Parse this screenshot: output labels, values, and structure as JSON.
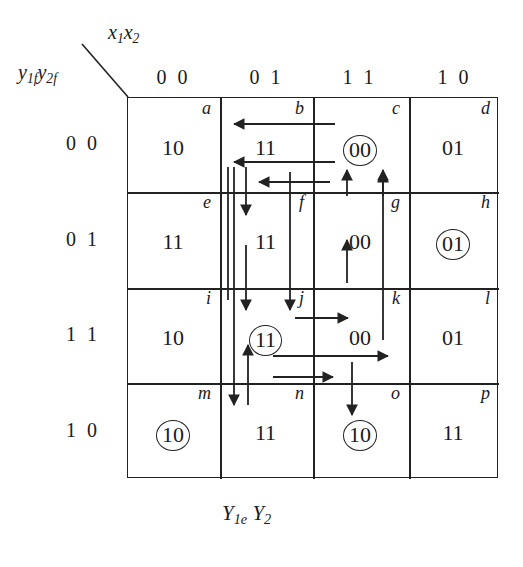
{
  "captions": {
    "top_input": "x1x2",
    "top_input_base": "x",
    "left_state": "y1f y2f",
    "bottom_output": "Y1e Y2"
  },
  "column_headers": [
    "0 0",
    "0 1",
    "1 1",
    "1 0"
  ],
  "row_headers": [
    "0 0",
    "0 1",
    "1 1",
    "1 0"
  ],
  "cells": [
    {
      "id": "a",
      "value": "10",
      "circled": false,
      "row": 0,
      "col": 0
    },
    {
      "id": "b",
      "value": "11",
      "circled": false,
      "row": 0,
      "col": 1
    },
    {
      "id": "c",
      "value": "00",
      "circled": true,
      "row": 0,
      "col": 2
    },
    {
      "id": "d",
      "value": "01",
      "circled": false,
      "row": 0,
      "col": 3
    },
    {
      "id": "e",
      "value": "11",
      "circled": false,
      "row": 1,
      "col": 0
    },
    {
      "id": "f",
      "value": "11",
      "circled": false,
      "row": 1,
      "col": 1
    },
    {
      "id": "g",
      "value": "00",
      "circled": false,
      "row": 1,
      "col": 2
    },
    {
      "id": "h",
      "value": "01",
      "circled": true,
      "row": 1,
      "col": 3
    },
    {
      "id": "i",
      "value": "10",
      "circled": false,
      "row": 2,
      "col": 0
    },
    {
      "id": "j",
      "value": "11",
      "circled": true,
      "row": 2,
      "col": 1
    },
    {
      "id": "k",
      "value": "00",
      "circled": false,
      "row": 2,
      "col": 2
    },
    {
      "id": "l",
      "value": "01",
      "circled": false,
      "row": 2,
      "col": 3
    },
    {
      "id": "m",
      "value": "10",
      "circled": true,
      "row": 3,
      "col": 0
    },
    {
      "id": "n",
      "value": "11",
      "circled": false,
      "row": 3,
      "col": 1
    },
    {
      "id": "o",
      "value": "10",
      "circled": true,
      "row": 3,
      "col": 2
    },
    {
      "id": "p",
      "value": "11",
      "circled": false,
      "row": 3,
      "col": 3
    }
  ],
  "colors": {
    "ink": "#222222",
    "paper": "#ffffff"
  }
}
